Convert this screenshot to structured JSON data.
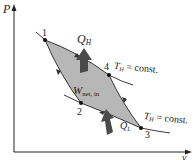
{
  "axes": {
    "y_label": "P",
    "x_label": "v"
  },
  "points": [
    {
      "id": "1",
      "label": "1"
    },
    {
      "id": "2",
      "label": "2"
    },
    {
      "id": "3",
      "label": "3"
    },
    {
      "id": "4",
      "label": "4"
    }
  ],
  "heat": {
    "q_high_main": "Q",
    "q_high_sub": "H",
    "q_low_main": "Q",
    "q_low_sub": "L"
  },
  "work": {
    "main": "W",
    "sub": "net, in"
  },
  "isotherms": {
    "upper_main": "T",
    "upper_sub": "H",
    "upper_rest": " = const.",
    "lower_main": "T",
    "lower_sub": "H",
    "lower_rest": " = const."
  },
  "colors": {
    "cycle_fill": "#b7b7b7",
    "arrow_fill": "#4a4a4a",
    "line": "#222222"
  }
}
